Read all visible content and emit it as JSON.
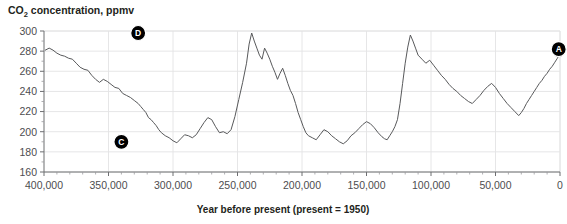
{
  "chart_data": {
    "type": "line",
    "title": "CO2 concentration, ppmv",
    "title_main": "CO",
    "title_sub": "2",
    "title_rest": " concentration, ppmv",
    "xlabel": "Year before present (present = 1950)",
    "ylabel": "CO2 concentration, ppmv",
    "xlim": [
      400000,
      0
    ],
    "ylim": [
      160,
      300
    ],
    "x_inverted": true,
    "grid": "horizontal-and-vertical",
    "legend": "none",
    "y_ticks": [
      300,
      280,
      260,
      240,
      220,
      200,
      180,
      160
    ],
    "y_tick_labels": [
      "300",
      "280",
      "260",
      "240",
      "220",
      "200",
      "180",
      "160"
    ],
    "y_minor_step": 10,
    "x_ticks": [
      400000,
      350000,
      300000,
      250000,
      200000,
      150000,
      100000,
      50000,
      0
    ],
    "x_tick_labels": [
      "400,000",
      "350,000",
      "300,000",
      "250,000",
      "200,000",
      "150,000",
      "100,000",
      "50,000",
      "0"
    ],
    "x_minor_step": 10000,
    "line_color": "#58595b",
    "series": [
      {
        "name": "CO2 concentration",
        "units": "ppmv",
        "x": [
          399000,
          396000,
          393000,
          390000,
          387000,
          384000,
          381000,
          378000,
          375000,
          372000,
          369000,
          366000,
          363000,
          360000,
          357000,
          354000,
          351000,
          348000,
          345000,
          342000,
          339000,
          336000,
          333000,
          330000,
          327000,
          325000,
          323000,
          321000,
          319000,
          317000,
          315000,
          313000,
          311000,
          309000,
          306000,
          303000,
          300000,
          297000,
          294000,
          291000,
          288000,
          285000,
          282000,
          279000,
          276000,
          273000,
          270000,
          267000,
          264000,
          261000,
          258000,
          255000,
          252000,
          249000,
          246000,
          243000,
          241000,
          239000,
          237000,
          235000,
          233000,
          231000,
          229000,
          227000,
          225000,
          223000,
          221000,
          219000,
          217000,
          215000,
          213000,
          211000,
          209000,
          207000,
          205000,
          203000,
          201000,
          199000,
          197000,
          195000,
          192000,
          189000,
          186000,
          183000,
          180000,
          177000,
          174000,
          171000,
          168000,
          165000,
          162000,
          159000,
          156000,
          153000,
          150000,
          147000,
          144000,
          141000,
          138000,
          136000,
          134000,
          132000,
          130000,
          128000,
          126000,
          124000,
          122000,
          120000,
          118000,
          116000,
          114000,
          112000,
          110000,
          107000,
          104000,
          101000,
          98000,
          95000,
          92000,
          89000,
          86000,
          83000,
          80000,
          77000,
          74000,
          71000,
          68000,
          65000,
          62000,
          59000,
          56000,
          53000,
          50000,
          47000,
          44000,
          41000,
          38000,
          35000,
          32000,
          30000,
          28000,
          26000,
          24000,
          22000,
          20000,
          18000,
          16000,
          14000,
          12000,
          10000,
          8000,
          6000,
          4000,
          2000,
          500
        ],
        "y": [
          281,
          283,
          281,
          278,
          276,
          275,
          273,
          272,
          268,
          264,
          262,
          261,
          256,
          252,
          249,
          252,
          250,
          247,
          244,
          243,
          238,
          236,
          234,
          231,
          228,
          225,
          222,
          219,
          214,
          212,
          209,
          206,
          202,
          199,
          196,
          194,
          191,
          189,
          193,
          197,
          196,
          194,
          197,
          203,
          209,
          214,
          212,
          205,
          199,
          200,
          198,
          202,
          215,
          232,
          249,
          268,
          287,
          298,
          290,
          283,
          276,
          272,
          283,
          278,
          272,
          265,
          259,
          252,
          258,
          263,
          256,
          248,
          241,
          236,
          228,
          219,
          212,
          205,
          199,
          196,
          194,
          192,
          197,
          202,
          200,
          196,
          193,
          190,
          188,
          191,
          196,
          199,
          203,
          207,
          210,
          208,
          204,
          199,
          195,
          193,
          192,
          196,
          200,
          205,
          212,
          228,
          248,
          268,
          284,
          296,
          290,
          283,
          276,
          272,
          268,
          271,
          266,
          261,
          256,
          252,
          247,
          243,
          240,
          236,
          233,
          230,
          228,
          232,
          236,
          241,
          245,
          248,
          244,
          238,
          233,
          228,
          224,
          220,
          216,
          219,
          223,
          228,
          232,
          236,
          240,
          244,
          248,
          251,
          255,
          258,
          262,
          265,
          269,
          273,
          276
        ]
      }
    ],
    "annotations": [
      {
        "label": "D",
        "x": 327000,
        "y": 298,
        "description": "interglacial-peak-marker-d"
      },
      {
        "label": "C",
        "x": 340000,
        "y": 190,
        "description": "glacial-minimum-marker-c"
      },
      {
        "label": "A",
        "x": 1000,
        "y": 282,
        "description": "present-day-marker-a"
      }
    ]
  },
  "chart_accent": "#000000"
}
